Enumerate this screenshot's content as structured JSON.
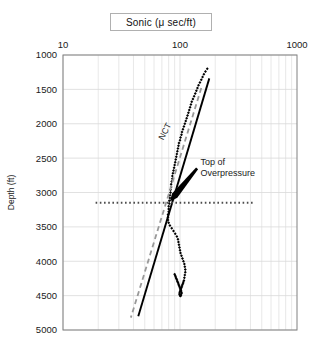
{
  "title": {
    "text": "Sonic (μ sec/ft)"
  },
  "axis": {
    "x_label": "",
    "y_label": "Depth (ft)",
    "x_ticks": [
      "10",
      "100",
      "1000"
    ],
    "y_ticks": [
      "1000",
      "1500",
      "2000",
      "2500",
      "3000",
      "3500",
      "4000",
      "4500",
      "5000"
    ]
  },
  "annotations": {
    "nct": "NCT",
    "top_of_overpressure_line1": "Top of",
    "top_of_overpressure_line2": "Overpressure"
  },
  "colors": {
    "data_points": "#000000",
    "trend_solid": "#000000",
    "trend_dashed": "#999999",
    "marker_line": "#4d4d4d",
    "grid": "#d9d9d9",
    "frame": "#808080"
  },
  "chart_data": {
    "type": "scatter",
    "title": "Sonic (μ sec/ft)",
    "xlabel": "Sonic (μ sec/ft)",
    "ylabel": "Depth (ft)",
    "xscale": "log",
    "xlim": [
      10,
      1000
    ],
    "ylim": [
      5000,
      1000
    ],
    "y_inverted": true,
    "grid": true,
    "legend": "none",
    "series": [
      {
        "name": "Sonic log data",
        "style": "points",
        "marker": "filled-diamond",
        "x": [
          171,
          165,
          160,
          156,
          152,
          148,
          144,
          141,
          138,
          135,
          132,
          129,
          126,
          124,
          122,
          120,
          118,
          116,
          114,
          112,
          110,
          108,
          106,
          104,
          103,
          101,
          100,
          98,
          97,
          96,
          95,
          94,
          93,
          92,
          91,
          90,
          89,
          88,
          87,
          86,
          86,
          85,
          84,
          84,
          83,
          83,
          82,
          82,
          81,
          81,
          80,
          80,
          80,
          79,
          79,
          79,
          80,
          82,
          85,
          88,
          91,
          94,
          96,
          97,
          98,
          99,
          100,
          101,
          103,
          105,
          107,
          109,
          110,
          111,
          111,
          110,
          109,
          108,
          107,
          106,
          105,
          104,
          103,
          102,
          101,
          100,
          99,
          99,
          100,
          101,
          102,
          103,
          103,
          102,
          101,
          100,
          99,
          98,
          97,
          96,
          95,
          94,
          93,
          92,
          91,
          90
        ],
        "y": [
          1200,
          1240,
          1280,
          1320,
          1360,
          1400,
          1440,
          1480,
          1520,
          1560,
          1600,
          1640,
          1680,
          1720,
          1760,
          1800,
          1840,
          1880,
          1920,
          1960,
          2000,
          2040,
          2080,
          2120,
          2160,
          2200,
          2240,
          2280,
          2320,
          2360,
          2400,
          2440,
          2480,
          2520,
          2560,
          2600,
          2640,
          2680,
          2720,
          2760,
          2800,
          2840,
          2880,
          2920,
          2960,
          3000,
          3040,
          3080,
          3120,
          3160,
          3200,
          3240,
          3280,
          3320,
          3360,
          3400,
          3440,
          3480,
          3520,
          3560,
          3600,
          3640,
          3680,
          3720,
          3760,
          3800,
          3840,
          3880,
          3920,
          3960,
          4000,
          4040,
          4080,
          4120,
          4160,
          4200,
          4240,
          4280,
          4300,
          4320,
          4340,
          4360,
          4380,
          4400,
          4420,
          4440,
          4460,
          4480,
          4500,
          4505,
          4490,
          4470,
          4450,
          4430,
          4410,
          4390,
          4370,
          4350,
          4330,
          4310,
          4290,
          4270,
          4250,
          4230,
          4210,
          4190
        ]
      },
      {
        "name": "Normal compaction trend (solid)",
        "style": "line",
        "dash": "solid",
        "x": [
          178,
          44
        ],
        "y": [
          1340,
          4800
        ]
      },
      {
        "name": "Normal compaction trend (dashed)",
        "style": "line",
        "dash": "dashed",
        "x": [
          152,
          38
        ],
        "y": [
          1480,
          4820
        ]
      },
      {
        "name": "Top of overpressure marker",
        "style": "hline",
        "dash": "dotted",
        "y": 3150,
        "x_start": 19,
        "x_end": 430
      }
    ],
    "annotations": [
      {
        "text": "NCT",
        "x": 78,
        "y": 2130,
        "rotation": -62
      },
      {
        "text": "Top of",
        "x": 150,
        "y": 2560
      },
      {
        "text": "Overpressure",
        "x": 150,
        "y": 2720
      },
      {
        "text": "arrow",
        "from_x": 140,
        "from_y": 2650,
        "to_x": 82,
        "to_y": 3130
      }
    ]
  }
}
